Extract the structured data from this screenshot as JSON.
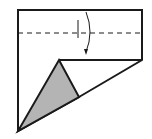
{
  "diagram": {
    "type": "origami-fold-step",
    "colors": {
      "stroke": "#1a1a1a",
      "paper": "#ffffff",
      "shaded_flap": "#b4b4b4"
    },
    "outline_points": "18,10 142,10 142,60 79,97 18,131",
    "inner_edge_points": "59,60 142,60",
    "shaded_triangle_points": "59,60 79,97 18,131",
    "fold_line": {
      "x1": 18,
      "y1": 33,
      "x2": 142,
      "y2": 33,
      "style": "dashed-valley"
    },
    "crease_mark": {
      "x1": 78,
      "y1": 20,
      "x2": 78,
      "y2": 38
    },
    "arrow": {
      "path": "M86,12 Q94,32 86,52",
      "direction": "down"
    }
  }
}
